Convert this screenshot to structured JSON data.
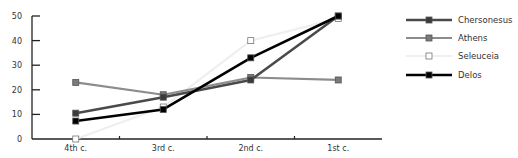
{
  "chart_data": {
    "type": "line",
    "title": "",
    "xlabel": "",
    "ylabel": "",
    "categories": [
      "4th c.",
      "3rd c.",
      "2nd c.",
      "1st c."
    ],
    "ylim": [
      0,
      50
    ],
    "yticks": [
      0,
      10,
      20,
      30,
      40,
      50
    ],
    "grid": false,
    "legend_position": "right",
    "series": [
      {
        "name": "Chersonesus",
        "values": [
          10.5,
          17,
          24,
          50
        ],
        "color": "#4a4a4a",
        "marker_fill": "#3a3a3a",
        "line_width": 2.6
      },
      {
        "name": "Athens",
        "values": [
          23,
          18,
          25,
          24
        ],
        "color": "#8c8c8c",
        "marker_fill": "#7a7a7a",
        "line_width": 2.2
      },
      {
        "name": "Seleuceia",
        "values": [
          0,
          13,
          40,
          49
        ],
        "color": "#efefef",
        "marker_fill": "#ffffff",
        "line_width": 2.2
      },
      {
        "name": "Delos",
        "values": [
          7.3,
          12,
          33,
          50
        ],
        "color": "#000000",
        "marker_fill": "#000000",
        "line_width": 2.6
      }
    ]
  }
}
